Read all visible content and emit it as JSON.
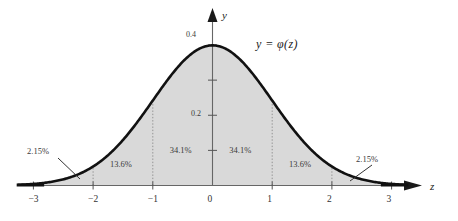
{
  "figure": {
    "title_text": "",
    "background_color": "#ffffff",
    "curve_color": "#111111",
    "fill_color": "#d9d9d9",
    "axis_color": "#555555",
    "guide_color": "#8a8a8a",
    "equation_label": "y = φ(z)",
    "y_axis_name": "y",
    "x_axis_name": "z"
  },
  "axes": {
    "x_ticks": [
      "−3",
      "−2",
      "−1",
      "0",
      "1",
      "2",
      "3"
    ],
    "x_tick_values": [
      -3,
      -2,
      -1,
      0,
      1,
      2,
      3
    ],
    "y_ticks": [
      "0.2",
      "0.4"
    ],
    "y_tick_values": [
      0.2,
      0.4
    ],
    "y_minor_tick_values": [
      0.1,
      0.3
    ],
    "xlim": [
      -3.45,
      3.55
    ],
    "ylim": [
      0,
      0.47
    ]
  },
  "region_labels": [
    {
      "text": "13.6%",
      "z": -1.5,
      "y_frac": 0.14
    },
    {
      "text": "34.1%",
      "z": -0.5,
      "y_frac": 0.24
    },
    {
      "text": "34.1%",
      "z": 0.5,
      "y_frac": 0.24
    },
    {
      "text": "13.6%",
      "z": 1.5,
      "y_frac": 0.14
    }
  ],
  "tail_labels": [
    {
      "text": "2.15%",
      "side": "left",
      "z": -2.5
    },
    {
      "text": "2.15%",
      "side": "right",
      "z": 2.5
    }
  ],
  "chart_data": {
    "type": "area",
    "xlabel": "z",
    "ylabel": "y",
    "curve_equation": "y = φ(z)",
    "xlim": [
      -3.45,
      3.55
    ],
    "ylim": [
      0,
      0.47
    ],
    "grid": false,
    "legend": "none",
    "x_tick_labels": [
      "−3",
      "−2",
      "−1",
      "0",
      "1",
      "2",
      "3"
    ],
    "y_tick_labels": [
      "0.2",
      "0.4"
    ],
    "series": [
      {
        "name": "φ(z) standard normal density",
        "x": [
          -3.4,
          -3.2,
          -3.0,
          -2.8,
          -2.6,
          -2.4,
          -2.2,
          -2.0,
          -1.8,
          -1.6,
          -1.4,
          -1.2,
          -1.0,
          -0.8,
          -0.6,
          -0.4,
          -0.2,
          0.0,
          0.2,
          0.4,
          0.6,
          0.8,
          1.0,
          1.2,
          1.4,
          1.6,
          1.8,
          2.0,
          2.2,
          2.4,
          2.6,
          2.8,
          3.0,
          3.2,
          3.4
        ],
        "values": [
          0.0012,
          0.0024,
          0.0044,
          0.0079,
          0.0136,
          0.0224,
          0.0355,
          0.054,
          0.079,
          0.1109,
          0.1497,
          0.1942,
          0.242,
          0.2897,
          0.3332,
          0.3683,
          0.391,
          0.3989,
          0.391,
          0.3683,
          0.3332,
          0.2897,
          0.242,
          0.1942,
          0.1497,
          0.1109,
          0.079,
          0.054,
          0.0355,
          0.0224,
          0.0136,
          0.0079,
          0.0044,
          0.0024,
          0.0012
        ]
      }
    ],
    "area_annotations": [
      {
        "interval": [
          -3,
          -2
        ],
        "label": "2.15%",
        "value": 2.15
      },
      {
        "interval": [
          -2,
          -1
        ],
        "label": "13.6%",
        "value": 13.6
      },
      {
        "interval": [
          -1,
          0
        ],
        "label": "34.1%",
        "value": 34.1
      },
      {
        "interval": [
          0,
          1
        ],
        "label": "34.1%",
        "value": 34.1
      },
      {
        "interval": [
          1,
          2
        ],
        "label": "13.6%",
        "value": 13.6
      },
      {
        "interval": [
          2,
          3
        ],
        "label": "2.15%",
        "value": 2.15
      }
    ],
    "peak_value": 0.4
  }
}
